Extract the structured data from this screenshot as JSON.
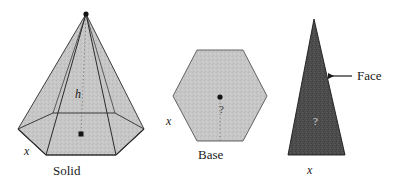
{
  "figure": {
    "background_color": "#ffffff",
    "ink_color": "#1a1a1a",
    "solid": {
      "caption": "Solid",
      "edge_label": "x",
      "height_label": "h",
      "fill_color": "#c4c4c4",
      "stroke_color": "#2b2b2b",
      "apex_dot": "apex-vertex-dot",
      "center_dot": "base-center-dot"
    },
    "base": {
      "caption": "Base",
      "edge_label": "x",
      "apothem_label": "?",
      "fill_color": "#c9c9c9",
      "stroke_color": "#4a4a4a",
      "center_dot": "hexagon-center-dot"
    },
    "face": {
      "caption": "Face",
      "base_label": "x",
      "slant_label": "?",
      "fill_color": "#4a4a4a",
      "stroke_color": "#1a1a1a",
      "pointer": "arrow-left"
    }
  }
}
